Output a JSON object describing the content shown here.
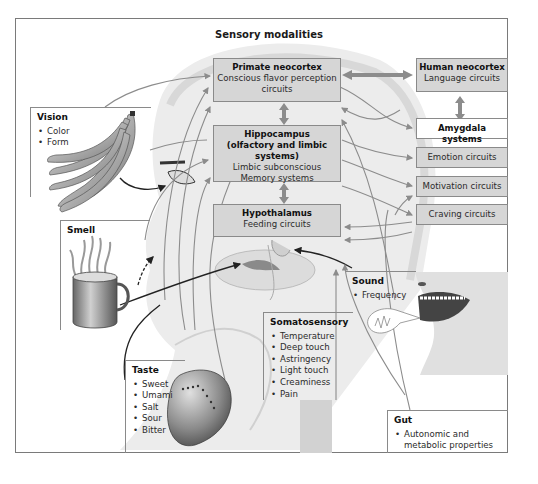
{
  "title": "Sensory modalities",
  "brain_boxes": {
    "primate_neocortex": {
      "heading": "Primate neocortex",
      "lines": [
        "Conscious flavor perception",
        "circuits"
      ]
    },
    "hippocampus": {
      "heading_lines": [
        "Hippocampus",
        "(olfactory and limbic systems)"
      ],
      "lines": [
        "Limbic subconscious",
        "Memory systems"
      ]
    },
    "hypothalamus": {
      "heading": "Hypothalamus",
      "lines": [
        "Feeding circuits"
      ]
    }
  },
  "right_boxes": {
    "human_neocortex": {
      "heading": "Human neocortex",
      "line": "Language circuits"
    },
    "amygdala": {
      "heading": "Amygdala systems"
    },
    "emotion": {
      "label": "Emotion circuits"
    },
    "motivation": {
      "label": "Motivation circuits"
    },
    "craving": {
      "label": "Craving circuits"
    }
  },
  "panels": {
    "vision": {
      "heading": "Vision",
      "items": [
        "Color",
        "Form"
      ]
    },
    "smell": {
      "heading": "Smell"
    },
    "taste": {
      "heading": "Taste",
      "items": [
        "Sweet",
        "Umami",
        "Salt",
        "Sour",
        "Bitter"
      ]
    },
    "somatosensory": {
      "heading": "Somatosensory",
      "items": [
        "Temperature",
        "Deep touch",
        "Astringency",
        "Light touch",
        "Creaminess",
        "Pain"
      ]
    },
    "sound": {
      "heading": "Sound",
      "items": [
        "Frequency"
      ]
    },
    "gut": {
      "heading": "Gut",
      "items": [
        "Autonomic and metabolic properties"
      ]
    }
  },
  "colors": {
    "box_fill": "#d6d6d6",
    "box_border": "#8a8a8a",
    "arrow": "#8c8c8c",
    "head_shade": "#e6e6e6",
    "frame_border": "#7a7a7a"
  }
}
